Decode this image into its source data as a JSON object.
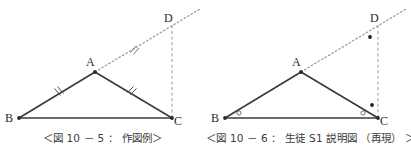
{
  "page": {
    "background": "#ffffff",
    "ink": "#3a3a3a",
    "dotted_ink": "#8a8a8a"
  },
  "figures": [
    {
      "id": "figure-10-5",
      "caption": "＜図 10 － 5 ： 作図例＞",
      "vertices": [
        {
          "name": "A",
          "label": "A",
          "x": 95,
          "y": 72,
          "label_dx": -9,
          "label_dy": -6
        },
        {
          "name": "B",
          "label": "B",
          "x": 19,
          "y": 118,
          "label_dx": -12,
          "label_dy": 4
        },
        {
          "name": "C",
          "label": "C",
          "x": 172,
          "y": 118,
          "label_dx": 4,
          "label_dy": 5
        },
        {
          "name": "D",
          "label": "D",
          "x": 172,
          "y": 27,
          "label_dx": -6,
          "label_dy": -5
        }
      ],
      "segments": [
        {
          "name": "segment-AB",
          "from": "A",
          "to": "B",
          "style": "solid"
        },
        {
          "name": "segment-AC",
          "from": "A",
          "to": "C",
          "style": "solid"
        },
        {
          "name": "segment-BC",
          "from": "B",
          "to": "C",
          "style": "solid"
        },
        {
          "name": "ray-AD",
          "from": "A",
          "to": "D",
          "style": "dotted"
        },
        {
          "name": "segment-CD",
          "from": "C",
          "to": "D",
          "style": "dashed"
        }
      ],
      "tick_marks": [
        {
          "name": "tick-AB",
          "on": "segment-AB",
          "kind": "double-hash"
        },
        {
          "name": "tick-AC",
          "on": "segment-AC",
          "kind": "double-hash"
        },
        {
          "name": "tick-AD",
          "on": "ray-AD",
          "kind": "double-hash"
        }
      ],
      "angle_marks": []
    },
    {
      "id": "figure-10-6",
      "caption": "＜図 10 － 6 ： 生徒 S1 説明図 （再現） ＞",
      "vertices": [
        {
          "name": "A",
          "label": "A",
          "x": 95,
          "y": 72,
          "label_dx": -9,
          "label_dy": -6
        },
        {
          "name": "B",
          "label": "B",
          "x": 19,
          "y": 118,
          "label_dx": -12,
          "label_dy": 4
        },
        {
          "name": "C",
          "label": "C",
          "x": 172,
          "y": 118,
          "label_dx": 4,
          "label_dy": 5
        },
        {
          "name": "D",
          "label": "D",
          "x": 172,
          "y": 27,
          "label_dx": -6,
          "label_dy": -5
        }
      ],
      "segments": [
        {
          "name": "segment-AB",
          "from": "A",
          "to": "B",
          "style": "solid"
        },
        {
          "name": "segment-AC",
          "from": "A",
          "to": "C",
          "style": "solid"
        },
        {
          "name": "segment-BC",
          "from": "B",
          "to": "C",
          "style": "solid"
        },
        {
          "name": "ray-AD",
          "from": "A",
          "to": "D",
          "style": "dotted"
        },
        {
          "name": "segment-CD",
          "from": "C",
          "to": "D",
          "style": "dashed"
        }
      ],
      "tick_marks": [],
      "angle_marks": [
        {
          "name": "angle-mark-B",
          "kind": "open-circle",
          "x": 33,
          "y": 113
        },
        {
          "name": "angle-mark-C",
          "kind": "open-circle",
          "x": 157,
          "y": 113
        },
        {
          "name": "angle-mark-C-filled",
          "kind": "filled-dot",
          "x": 166,
          "y": 106
        },
        {
          "name": "angle-mark-D-filled",
          "kind": "filled-dot",
          "x": 164,
          "y": 37
        }
      ]
    }
  ]
}
